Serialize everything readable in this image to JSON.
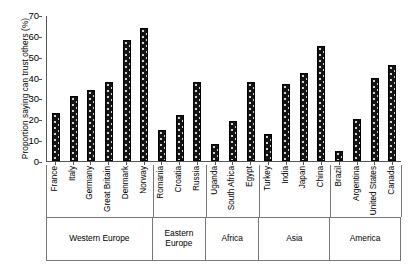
{
  "chart_data": {
    "type": "bar",
    "title": "",
    "xlabel": "",
    "ylabel": "Proportion saying can trust others (%)",
    "ylim": [
      0,
      70
    ],
    "yticks": [
      0,
      10,
      20,
      30,
      40,
      50,
      60,
      70
    ],
    "grid": false,
    "legend": "none",
    "categories": [
      "France",
      "Italy",
      "Germany",
      "Great Britain",
      "Denmark",
      "Norway",
      "Romania",
      "Croatia",
      "Russia",
      "Uganda",
      "South Africa",
      "Egypt",
      "Turkey",
      "India",
      "Japan",
      "China",
      "Brazil",
      "Argentina",
      "United States",
      "Canada"
    ],
    "values": [
      23,
      31,
      34,
      38,
      58,
      64,
      15,
      22,
      38,
      8,
      19,
      38,
      13,
      37,
      42,
      55,
      5,
      20,
      40,
      46
    ],
    "groups": [
      {
        "label": "Western Europe",
        "count": 6
      },
      {
        "label": "Eastern Europe",
        "count": 3
      },
      {
        "label": "Africa",
        "count": 3
      },
      {
        "label": "Asia",
        "count": 4
      },
      {
        "label": "America",
        "count": 4
      }
    ],
    "bar_color": "#141414"
  }
}
